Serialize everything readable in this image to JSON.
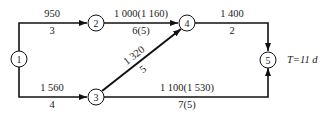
{
  "diagram": {
    "type": "network-schedule",
    "total_duration_label": "T=11 d",
    "nodes": [
      {
        "id": "1",
        "label": "1"
      },
      {
        "id": "2",
        "label": "2"
      },
      {
        "id": "3",
        "label": "3"
      },
      {
        "id": "4",
        "label": "4"
      },
      {
        "id": "5",
        "label": "5"
      }
    ],
    "edges": [
      {
        "from": "1",
        "to": "2",
        "cost": "950",
        "duration": "3"
      },
      {
        "from": "1",
        "to": "3",
        "cost": "1 560",
        "duration": "4"
      },
      {
        "from": "2",
        "to": "4",
        "cost": "1 000(1 160)",
        "duration": "6(5)"
      },
      {
        "from": "3",
        "to": "4",
        "cost": "1 320",
        "duration": "5"
      },
      {
        "from": "4",
        "to": "5",
        "cost": "1 400",
        "duration": "2"
      },
      {
        "from": "3",
        "to": "5",
        "cost": "1 100(1 530)",
        "duration": "7(5)"
      }
    ]
  }
}
